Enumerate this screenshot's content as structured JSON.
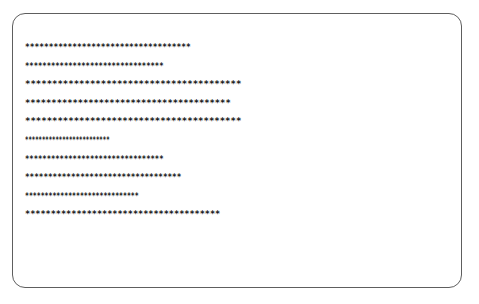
{
  "card": {
    "lines": [
      {
        "stars": 35
      },
      {
        "stars": 32
      },
      {
        "stars": 40
      },
      {
        "stars": 39
      },
      {
        "stars": 40
      },
      {
        "stars": 25
      },
      {
        "stars": 32
      },
      {
        "stars": 34
      },
      {
        "stars": 29
      },
      {
        "stars": 38
      }
    ],
    "glyph": "*"
  },
  "colors": {
    "border": "#5e5e5e",
    "text": "#1a1a1a",
    "background": "#ffffff"
  }
}
